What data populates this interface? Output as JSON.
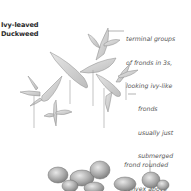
{
  "title": {
    "line1": "Ivy-leaved",
    "line2": "Duckweed"
  },
  "annotations": [
    {
      "id": "terminal-groups",
      "lines": [
        "terminal groups",
        "of fronds in 3s,",
        "looking ivy-like"
      ],
      "style": "italic"
    },
    {
      "id": "fronds-submerged",
      "lines": [
        "fronds",
        "usually just",
        "submerged"
      ],
      "style": "italic"
    },
    {
      "id": "frond-rounded",
      "lines": [
        "frond rounded",
        "convex above"
      ],
      "style": "italic"
    }
  ],
  "illustrations": [
    {
      "id": "ivy-leaved-duckweed",
      "icon": "branching-frond-drawing"
    },
    {
      "id": "duckweed-cluster",
      "icon": "rounded-frond-cluster-drawing"
    }
  ],
  "colors": {
    "background": "#ffffff",
    "title_text": "#2a2a2a",
    "note_text": "#555555",
    "leaf_fill": "#d6d6d6",
    "leaf_stroke": "#8a8a8a"
  }
}
